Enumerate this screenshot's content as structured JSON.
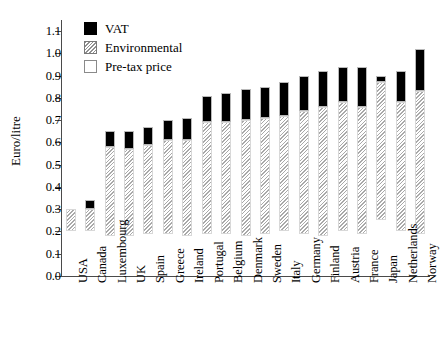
{
  "chart_data": {
    "type": "bar",
    "title": "",
    "subtitle": "",
    "xlabel": "",
    "ylabel": "Euro/litre",
    "ylim": [
      0.0,
      1.15
    ],
    "ytick_values": [
      0.0,
      0.1,
      0.2,
      0.3,
      0.4,
      0.5,
      0.6,
      0.7,
      0.8,
      0.9,
      1.0,
      1.1
    ],
    "ytick_labels": [
      "0.0",
      "0.1",
      "0.2",
      "0.3",
      "0.4",
      "0.5",
      "0.6",
      "0.7",
      "0.8",
      "0.9",
      "1.0",
      "1.1"
    ],
    "grid": false,
    "stacked": true,
    "legend_position": "top-left-inside",
    "legend": [
      {
        "name": "VAT",
        "swatch": "black-filled"
      },
      {
        "name": "Environmental",
        "swatch": "diagonal-hatched"
      },
      {
        "name": "Pre-tax price",
        "swatch": "white-empty"
      }
    ],
    "categories": [
      "USA",
      "Canada",
      "Luxembourg",
      "UK",
      "Spain",
      "Greece",
      "Ireland",
      "Portugal",
      "Belgium",
      "Denmark",
      "Sweden",
      "Italy",
      "Germany",
      "Finland",
      "Austria",
      "France",
      "Japan",
      "Netherlands",
      "Norway"
    ],
    "series": [
      {
        "name": "Pre-tax price",
        "values": [
          0.2,
          0.2,
          0.18,
          0.18,
          0.19,
          0.19,
          0.18,
          0.19,
          0.19,
          0.18,
          0.19,
          0.2,
          0.19,
          0.18,
          0.2,
          0.19,
          0.25,
          0.2,
          0.19
        ]
      },
      {
        "name": "Environmental",
        "values": [
          0.1,
          0.1,
          0.4,
          0.39,
          0.4,
          0.42,
          0.43,
          0.5,
          0.5,
          0.52,
          0.52,
          0.52,
          0.55,
          0.58,
          0.58,
          0.57,
          0.62,
          0.58,
          0.64
        ]
      },
      {
        "name": "VAT",
        "values": [
          0.0,
          0.04,
          0.07,
          0.08,
          0.08,
          0.09,
          0.1,
          0.12,
          0.13,
          0.14,
          0.14,
          0.15,
          0.16,
          0.16,
          0.16,
          0.18,
          0.03,
          0.14,
          0.19
        ]
      }
    ],
    "bar_tops": [
      0.3,
      0.34,
      0.65,
      0.65,
      0.67,
      0.7,
      0.71,
      0.81,
      0.82,
      0.84,
      0.85,
      0.87,
      0.9,
      0.92,
      0.94,
      0.94,
      0.9,
      0.92,
      1.02
    ],
    "segment_boundaries": [
      {
        "category": "USA",
        "pretax_top": 0.2,
        "env_top": 0.3,
        "vat_top": 0.3
      },
      {
        "category": "Canada",
        "pretax_top": 0.2,
        "env_top": 0.3,
        "vat_top": 0.34
      },
      {
        "category": "Luxembourg",
        "pretax_top": 0.18,
        "env_top": 0.58,
        "vat_top": 0.65
      },
      {
        "category": "UK",
        "pretax_top": 0.18,
        "env_top": 0.57,
        "vat_top": 0.65
      },
      {
        "category": "Spain",
        "pretax_top": 0.19,
        "env_top": 0.59,
        "vat_top": 0.67
      },
      {
        "category": "Greece",
        "pretax_top": 0.19,
        "env_top": 0.61,
        "vat_top": 0.7
      },
      {
        "category": "Ireland",
        "pretax_top": 0.18,
        "env_top": 0.61,
        "vat_top": 0.71
      },
      {
        "category": "Portugal",
        "pretax_top": 0.19,
        "env_top": 0.69,
        "vat_top": 0.81
      },
      {
        "category": "Belgium",
        "pretax_top": 0.19,
        "env_top": 0.69,
        "vat_top": 0.82
      },
      {
        "category": "Denmark",
        "pretax_top": 0.18,
        "env_top": 0.7,
        "vat_top": 0.84
      },
      {
        "category": "Sweden",
        "pretax_top": 0.19,
        "env_top": 0.71,
        "vat_top": 0.85
      },
      {
        "category": "Italy",
        "pretax_top": 0.2,
        "env_top": 0.72,
        "vat_top": 0.87
      },
      {
        "category": "Germany",
        "pretax_top": 0.19,
        "env_top": 0.74,
        "vat_top": 0.9
      },
      {
        "category": "Finland",
        "pretax_top": 0.18,
        "env_top": 0.76,
        "vat_top": 0.92
      },
      {
        "category": "Austria",
        "pretax_top": 0.2,
        "env_top": 0.78,
        "vat_top": 0.94
      },
      {
        "category": "France",
        "pretax_top": 0.19,
        "env_top": 0.76,
        "vat_top": 0.94
      },
      {
        "category": "Japan",
        "pretax_top": 0.25,
        "env_top": 0.87,
        "vat_top": 0.9
      },
      {
        "category": "Netherlands",
        "pretax_top": 0.2,
        "env_top": 0.78,
        "vat_top": 0.92
      },
      {
        "category": "Norway",
        "pretax_top": 0.19,
        "env_top": 0.83,
        "vat_top": 1.02
      }
    ]
  }
}
